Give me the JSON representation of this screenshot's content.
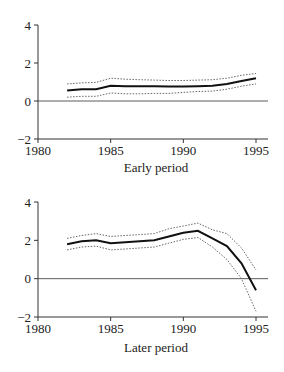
{
  "chart_data": [
    {
      "type": "line",
      "title": "",
      "xlabel": "Early period",
      "ylabel": "",
      "xlim": [
        1980,
        1996
      ],
      "ylim": [
        -2,
        4
      ],
      "xticks": [
        1980,
        1985,
        1990,
        1995
      ],
      "yticks": [
        4,
        2,
        0,
        -2
      ],
      "x": [
        1982,
        1983,
        1984,
        1985,
        1986,
        1987,
        1988,
        1989,
        1990,
        1991,
        1992,
        1993,
        1994,
        1995
      ],
      "series": [
        {
          "name": "estimate",
          "style": "solid",
          "values": [
            0.55,
            0.62,
            0.62,
            0.8,
            0.78,
            0.78,
            0.78,
            0.76,
            0.76,
            0.78,
            0.8,
            0.9,
            1.05,
            1.2
          ]
        },
        {
          "name": "upper band",
          "style": "dotted",
          "values": [
            0.9,
            0.95,
            0.98,
            1.2,
            1.15,
            1.12,
            1.1,
            1.08,
            1.08,
            1.1,
            1.12,
            1.2,
            1.35,
            1.45
          ]
        },
        {
          "name": "lower band",
          "style": "dotted",
          "values": [
            0.2,
            0.25,
            0.25,
            0.42,
            0.38,
            0.38,
            0.4,
            0.4,
            0.45,
            0.5,
            0.52,
            0.62,
            0.78,
            0.9
          ]
        }
      ],
      "zero_line": true,
      "grid": false,
      "legend": null
    },
    {
      "type": "line",
      "title": "",
      "xlabel": "Later period",
      "ylabel": "",
      "xlim": [
        1980,
        1996
      ],
      "ylim": [
        -2,
        4
      ],
      "xticks": [
        1980,
        1985,
        1990,
        1995
      ],
      "yticks": [
        4,
        2,
        0,
        -2
      ],
      "x": [
        1982,
        1983,
        1984,
        1985,
        1986,
        1987,
        1988,
        1989,
        1990,
        1991,
        1992,
        1993,
        1994,
        1995
      ],
      "series": [
        {
          "name": "estimate",
          "style": "solid",
          "values": [
            1.8,
            1.95,
            2.0,
            1.85,
            1.9,
            1.95,
            2.0,
            2.2,
            2.4,
            2.5,
            2.1,
            1.7,
            0.8,
            -0.6
          ]
        },
        {
          "name": "upper band",
          "style": "dotted",
          "values": [
            2.1,
            2.25,
            2.35,
            2.2,
            2.25,
            2.3,
            2.35,
            2.6,
            2.75,
            2.9,
            2.55,
            2.35,
            1.6,
            0.45
          ]
        },
        {
          "name": "lower band",
          "style": "dotted",
          "values": [
            1.5,
            1.65,
            1.7,
            1.5,
            1.55,
            1.6,
            1.65,
            1.85,
            2.05,
            2.15,
            1.65,
            1.0,
            0.0,
            -1.7
          ]
        }
      ],
      "zero_line": true,
      "grid": false,
      "legend": null
    }
  ]
}
